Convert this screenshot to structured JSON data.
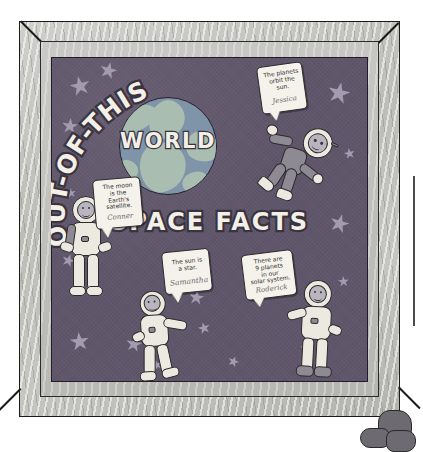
{
  "scene": {
    "kind": "classroom-bulletin-board-photo",
    "description": "Framed classroom display board with astronaut cutouts and signed speech bubbles"
  },
  "board": {
    "title_arc": "OUT-OF-THIS",
    "title_center": "WORLD",
    "title_bottom": "SPACE FACTS",
    "background_color": "#60566b",
    "star_color": "#a59bb0",
    "globe_color": "#7f94a8",
    "globe_land_color": "#a9bdb0",
    "title_text_color": "#f3f0e7",
    "title_outline_color": "#3a3340"
  },
  "frame": {
    "wood_color": "#c3c3be",
    "mat_color": "#c0c0bb",
    "outline_color": "#1b1b1b"
  },
  "notes": [
    {
      "id": "note-planets-orbit",
      "line1": "The planets",
      "line2": "orbit the",
      "line3": "sun.",
      "signature": "Jessica"
    },
    {
      "id": "note-moon-satellite",
      "line1": "The moon",
      "line2": "is the",
      "line3": "Earth's",
      "line4": "satellite.",
      "signature": "Conner"
    },
    {
      "id": "note-sun-star",
      "line1": "The sun is",
      "line2": "a star.",
      "signature": "Samantha"
    },
    {
      "id": "note-nine-planets",
      "line1": "There are",
      "line2": "9 planets",
      "line3": "in our",
      "line4": "solar system.",
      "signature": "Roderick"
    }
  ],
  "astronauts": [
    {
      "id": "astronaut-floating-top-right",
      "pose": "floating"
    },
    {
      "id": "astronaut-standing-left",
      "pose": "standing"
    },
    {
      "id": "astronaut-standing-center",
      "pose": "standing"
    },
    {
      "id": "astronaut-standing-right",
      "pose": "standing"
    }
  ]
}
